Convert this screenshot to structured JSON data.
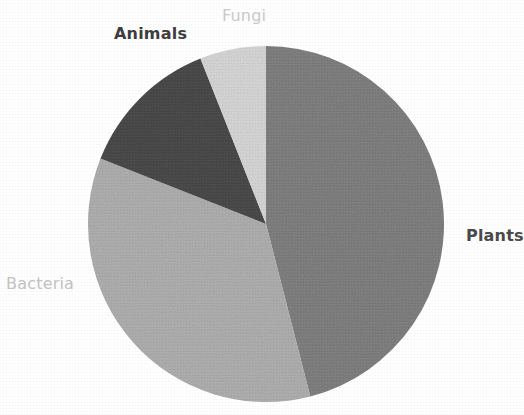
{
  "chart_data": {
    "type": "pie",
    "title": "",
    "subtitle": "",
    "xlabel": "",
    "ylabel": "",
    "legend_position": "none",
    "labels_position": "outside-adjacent-to-slice",
    "grid": false,
    "start_angle_deg": 0,
    "direction": "clockwise",
    "categories": [
      "Plants",
      "Bacteria",
      "Animals",
      "Fungi"
    ],
    "values": [
      46,
      35,
      13,
      6
    ],
    "value_unit": "percent",
    "slices": [
      {
        "label": "Plants",
        "value": 46,
        "start_angle_deg": 0,
        "end_angle_deg": 165.6,
        "color": "#808080",
        "label_color": "#4a4a4a",
        "label_weight": "bold"
      },
      {
        "label": "Bacteria",
        "value": 35,
        "start_angle_deg": 165.6,
        "end_angle_deg": 291.6,
        "color": "#b0b0b0",
        "label_color": "#c2c2c2",
        "label_weight": "normal"
      },
      {
        "label": "Animals",
        "value": 13,
        "start_angle_deg": 291.6,
        "end_angle_deg": 338.4,
        "color": "#4a4a4a",
        "label_color": "#3d3d3d",
        "label_weight": "bold"
      },
      {
        "label": "Fungi",
        "value": 6,
        "start_angle_deg": 338.4,
        "end_angle_deg": 360,
        "color": "#d8d8d8",
        "label_color": "#c9c9c9",
        "label_weight": "normal"
      }
    ]
  },
  "geometry": {
    "center_x": 266,
    "center_y": 224,
    "radius": 178
  },
  "colors": {
    "background": "#ffffff",
    "plants": "#808080",
    "bacteria": "#b0b0b0",
    "animals": "#4a4a4a",
    "fungi": "#d8d8d8"
  },
  "labels": {
    "plants": "Plants",
    "bacteria": "Bacteria",
    "animals": "Animals",
    "fungi": "Fungi"
  }
}
